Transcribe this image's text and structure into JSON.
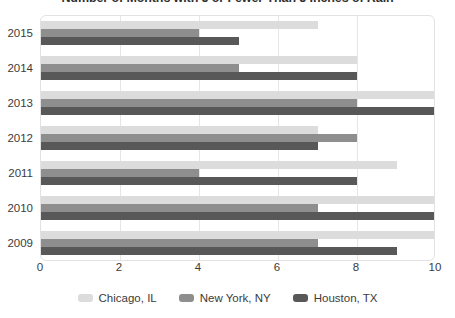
{
  "chart_data": {
    "type": "bar",
    "orientation": "horizontal",
    "title": "Number of Months with 5 or Fewer Than 5 Inches of Rain",
    "xlabel": "",
    "ylabel": "",
    "xlim": [
      0,
      10
    ],
    "xticks": [
      0,
      2,
      4,
      6,
      8,
      10
    ],
    "xtick_labels": [
      "0",
      "2",
      "4",
      "6",
      "8",
      "10"
    ],
    "grid": true,
    "legend_position": "bottom",
    "categories": [
      "2015",
      "2014",
      "2013",
      "2012",
      "2011",
      "2010",
      "2009"
    ],
    "series": [
      {
        "name": "Chicago, IL",
        "color": "#dcdcdc",
        "values": [
          7,
          8,
          10,
          7,
          9,
          10,
          10
        ]
      },
      {
        "name": "New York, NY",
        "color": "#8e8e8e",
        "values": [
          4,
          5,
          8,
          8,
          4,
          7,
          7
        ]
      },
      {
        "name": "Houston, TX",
        "color": "#585858",
        "values": [
          5,
          8,
          10,
          7,
          8,
          10,
          9
        ]
      }
    ]
  }
}
